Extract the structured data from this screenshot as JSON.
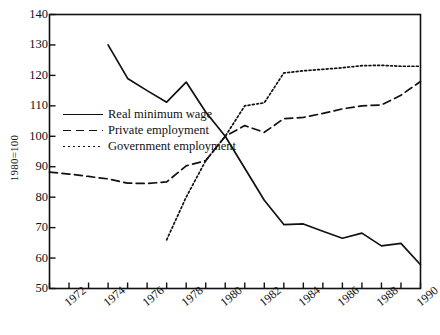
{
  "chart_data": {
    "type": "line",
    "title": "",
    "subtitle": "",
    "xlabel": "",
    "ylabel": "1980=100",
    "xlim": [
      1971,
      1990
    ],
    "ylim": [
      50,
      140
    ],
    "grid": false,
    "legend_position": "inside-left-middle",
    "y_ticks": [
      140,
      130,
      120,
      110,
      100,
      90,
      80,
      70,
      60,
      50
    ],
    "x_ticks": [
      1971,
      1972,
      1973,
      1974,
      1975,
      1976,
      1977,
      1978,
      1979,
      1980,
      1981,
      1982,
      1983,
      1984,
      1985,
      1986,
      1987,
      1988,
      1989,
      1990
    ],
    "x_tick_labels": [
      "",
      "1972",
      "",
      "1974",
      "",
      "1976",
      "",
      "1978",
      "",
      "1980",
      "",
      "1982",
      "",
      "1984",
      "",
      "1986",
      "",
      "1988",
      "",
      "1990"
    ],
    "series": [
      {
        "name": "Real minimum wage",
        "style": "solid",
        "color": "#111111",
        "x": [
          1974,
          1975,
          1976,
          1977,
          1978,
          1979,
          1980,
          1981,
          1982,
          1983,
          1984,
          1985,
          1986,
          1987,
          1988,
          1989,
          1990
        ],
        "values": [
          130.0,
          119.0,
          115.0,
          111.2,
          117.8,
          108.0,
          100.0,
          89.5,
          79.0,
          71.0,
          71.2,
          68.8,
          66.5,
          68.2,
          64.0,
          64.8,
          57.8
        ]
      },
      {
        "name": "Private employment",
        "style": "dashed",
        "color": "#111111",
        "x": [
          1971,
          1972,
          1973,
          1974,
          1975,
          1976,
          1977,
          1978,
          1979,
          1980,
          1981,
          1982,
          1983,
          1984,
          1985,
          1986,
          1987,
          1988,
          1989,
          1990
        ],
        "values": [
          88.2,
          87.6,
          86.8,
          86.0,
          84.6,
          84.5,
          85.0,
          90.3,
          92.0,
          100.0,
          103.5,
          101.3,
          105.8,
          106.2,
          107.5,
          109.0,
          110.0,
          110.3,
          113.5,
          118.0
        ]
      },
      {
        "name": "Government employment",
        "style": "dotted",
        "color": "#111111",
        "x": [
          1977,
          1978,
          1979,
          1980,
          1981,
          1982,
          1983,
          1984,
          1985,
          1986,
          1987,
          1988,
          1989,
          1990
        ],
        "values": [
          66.0,
          80.0,
          92.0,
          100.0,
          110.0,
          111.0,
          120.8,
          121.5,
          122.0,
          122.5,
          123.2,
          123.3,
          123.0,
          123.0
        ]
      }
    ],
    "legend": [
      {
        "label": "Real minimum wage",
        "style": "solid"
      },
      {
        "label": "Private employment",
        "style": "dashed"
      },
      {
        "label": "Government employment",
        "style": "dotted"
      }
    ]
  },
  "axes": {
    "y_axis_title": "1980=100"
  }
}
